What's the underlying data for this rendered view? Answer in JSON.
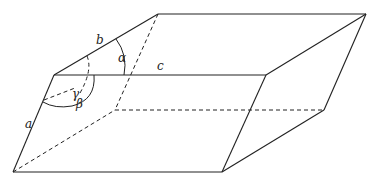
{
  "figure": {
    "type": "parallelepiped",
    "stroke_color": "#222222",
    "edge_labels": {
      "a": "a",
      "b": "b",
      "c": "c"
    },
    "angle_labels": {
      "alpha": "α",
      "beta": "β",
      "gamma": "γ"
    }
  }
}
